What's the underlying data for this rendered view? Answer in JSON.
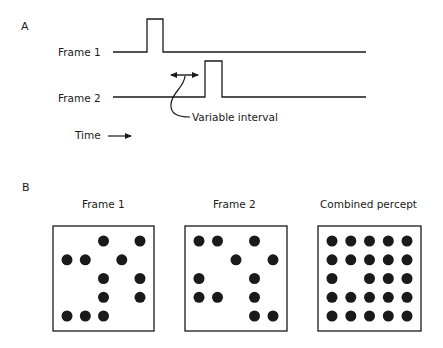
{
  "panel_a": {
    "letter": "A",
    "frame1_label": "Frame 1",
    "frame2_label": "Frame 2",
    "interval_label": "Variable interval",
    "time_label": "Time",
    "time_arrow": "→",
    "traces": [
      {
        "name": "frame-1-trace",
        "baseline_y": 52,
        "x_start": 113,
        "x_end": 366,
        "pulse_x1": 147,
        "pulse_x2": 163,
        "pulse_top": 19
      },
      {
        "name": "frame-2-trace",
        "baseline_y": 97,
        "x_start": 113,
        "x_end": 366,
        "pulse_x1": 205,
        "pulse_x2": 222,
        "pulse_top": 61
      }
    ]
  },
  "panel_b": {
    "letter": "B",
    "grid_size": 5,
    "frames": [
      {
        "title": "Frame 1",
        "box": {
          "x": 53,
          "y": 226,
          "w": 101,
          "h": 105
        },
        "dots": [
          [
            0,
            0,
            1,
            0,
            1
          ],
          [
            1,
            1,
            0,
            1,
            0
          ],
          [
            0,
            0,
            1,
            0,
            1
          ],
          [
            0,
            0,
            1,
            0,
            1
          ],
          [
            1,
            1,
            1,
            0,
            0
          ]
        ]
      },
      {
        "title": "Frame 2",
        "box": {
          "x": 185,
          "y": 226,
          "w": 102,
          "h": 105
        },
        "dots": [
          [
            1,
            1,
            0,
            1,
            0
          ],
          [
            0,
            0,
            1,
            0,
            1
          ],
          [
            1,
            0,
            0,
            1,
            0
          ],
          [
            1,
            1,
            0,
            1,
            0
          ],
          [
            0,
            0,
            0,
            1,
            1
          ]
        ]
      },
      {
        "title": "Combined percept",
        "box": {
          "x": 318,
          "y": 226,
          "w": 103,
          "h": 105
        },
        "dots": [
          [
            1,
            1,
            1,
            1,
            1
          ],
          [
            1,
            1,
            1,
            1,
            1
          ],
          [
            1,
            0,
            1,
            1,
            1
          ],
          [
            1,
            1,
            1,
            1,
            1
          ],
          [
            1,
            1,
            1,
            1,
            1
          ]
        ]
      }
    ]
  },
  "colors": {
    "ink": "#1a1a1a",
    "background": "#ffffff"
  }
}
